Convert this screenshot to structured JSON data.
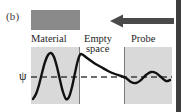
{
  "figure": {
    "panel_label": "(b)",
    "psi_symbol": "ψ"
  },
  "labels": {
    "material": "Material",
    "empty": "Empty",
    "space": "space",
    "probe": "Probe"
  },
  "colors": {
    "material_block": "#8a8a8a",
    "region_fill": "#d9d9d9",
    "curve": "#111111",
    "baseline": "#3c3c3c",
    "divider": "#7b7b7b",
    "arrow": "#4a4a4a",
    "page_edge": "#3d3d3d",
    "background": "#ffffff"
  },
  "chart_data": {
    "type": "line",
    "title": "(b)",
    "xlabel": "",
    "ylabel": "ψ",
    "grid": false,
    "legend": "none",
    "annotations": [
      "Material",
      "Empty space",
      "Probe"
    ],
    "regions": [
      {
        "name": "Material",
        "x_start": 0,
        "x_end": 48
      },
      {
        "name": "Empty space",
        "x_start": 48,
        "x_end": 93
      },
      {
        "name": "Probe",
        "x_start": 93,
        "x_end": 141
      }
    ],
    "baseline_y": 30,
    "series": [
      {
        "name": "wavefunction",
        "points": [
          [
            2,
            52
          ],
          [
            5,
            47
          ],
          [
            8,
            38
          ],
          [
            11,
            26
          ],
          [
            14,
            15
          ],
          [
            17,
            8
          ],
          [
            20,
            6
          ],
          [
            23,
            10
          ],
          [
            26,
            20
          ],
          [
            29,
            33
          ],
          [
            32,
            45
          ],
          [
            35,
            52
          ],
          [
            38,
            50
          ],
          [
            41,
            40
          ],
          [
            44,
            26
          ],
          [
            47,
            13
          ],
          [
            50,
            7
          ],
          [
            56,
            11
          ],
          [
            63,
            16
          ],
          [
            70,
            20
          ],
          [
            77,
            24
          ],
          [
            84,
            27
          ],
          [
            90,
            29
          ],
          [
            95,
            31
          ],
          [
            100,
            35
          ],
          [
            105,
            36
          ],
          [
            110,
            33
          ],
          [
            115,
            28
          ],
          [
            120,
            25
          ],
          [
            125,
            26
          ],
          [
            130,
            30
          ],
          [
            135,
            34
          ],
          [
            139,
            33
          ]
        ]
      }
    ],
    "baseline_series": {
      "name": "psi-zero-dashed",
      "style": "dashed",
      "y": 30,
      "x_start": 0,
      "x_end": 141
    }
  },
  "arrow": {
    "direction": "left",
    "name": "incoming-probe-arrow"
  }
}
